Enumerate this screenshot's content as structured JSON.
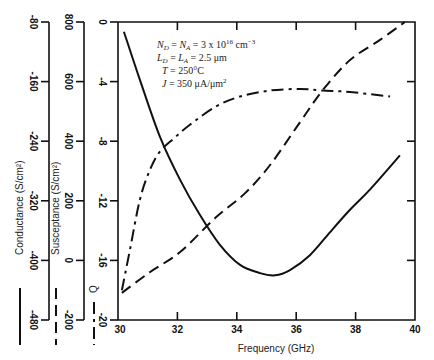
{
  "chart_data": {
    "type": "line",
    "title": "",
    "xlabel": "Frequency (GHz)",
    "xlim": [
      30,
      40
    ],
    "xticks": [
      30,
      32,
      34,
      36,
      38,
      40
    ],
    "grid": false,
    "annotations": [
      "N_D = N_A = 3 x 10^16 cm^-3",
      "L_D = L_A = 2.5 μm",
      "T  =  250°C",
      "J  =  350  μA/μm²"
    ],
    "axes": [
      {
        "name": "Conductance",
        "label": "Conductance (S/cm²)",
        "ylim": [
          -480,
          -80
        ],
        "ticks": [
          -80,
          -160,
          -240,
          -320,
          -400,
          -480
        ],
        "legend_style": "solid"
      },
      {
        "name": "Susceptance",
        "label": "Susceptance (S/cm²)",
        "ylim": [
          -200,
          800
        ],
        "ticks": [
          800,
          600,
          400,
          200,
          0,
          -200
        ],
        "legend_style": "long-dash"
      },
      {
        "name": "Q",
        "label": "Q",
        "ylim": [
          -20,
          0
        ],
        "ticks": [
          0,
          -4,
          -8,
          -12,
          -16,
          -20
        ],
        "legend_style": "dash-dot"
      }
    ],
    "series": [
      {
        "name": "Conductance",
        "axis": "Conductance",
        "style": "solid",
        "x": [
          30.2,
          30.74,
          31.41,
          32.09,
          32.76,
          33.43,
          34.11,
          34.78,
          35.29,
          35.79,
          36.46,
          37.14,
          37.81,
          38.48,
          39.49
        ],
        "y": [
          -93,
          -158,
          -234,
          -292,
          -339,
          -379,
          -406,
          -417,
          -420,
          -413,
          -393,
          -362,
          -332,
          -305,
          -259
        ]
      },
      {
        "name": "Susceptance",
        "axis": "Susceptance",
        "style": "long-dash",
        "x": [
          30.13,
          31.08,
          32.09,
          33.27,
          34.28,
          35.12,
          36.13,
          36.9,
          37.81,
          38.82,
          39.66
        ],
        "y": [
          -109,
          -39,
          28,
          142,
          226,
          320,
          464,
          572,
          672,
          740,
          800
        ]
      },
      {
        "name": "Q",
        "axis": "Q",
        "style": "dash-dot",
        "x": [
          30.13,
          30.4,
          30.74,
          31.08,
          31.41,
          31.89,
          32.42,
          33.27,
          34.11,
          35.12,
          36.13,
          36.9,
          37.81,
          39.16
        ],
        "y": [
          -18.0,
          -15.3,
          -11.9,
          -9.9,
          -8.7,
          -7.8,
          -6.9,
          -5.7,
          -5.0,
          -4.6,
          -4.5,
          -4.6,
          -4.7,
          -5.0
        ]
      }
    ]
  }
}
